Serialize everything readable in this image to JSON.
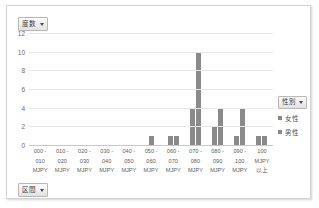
{
  "chart": {
    "value_field_label": "度数",
    "axis_field_label": "区間",
    "dropdown_icon": "chevron-down-icon"
  },
  "legend": {
    "title": "性別",
    "dropdown_icon": "chevron-down-icon",
    "entries": [
      {
        "label": "女性",
        "color": "#8a8a8a"
      },
      {
        "label": "男性",
        "color": "#8a8a8a"
      }
    ]
  },
  "chart_data": {
    "type": "bar",
    "title": "度数",
    "xlabel": "区間",
    "ylabel": "度数",
    "ylim": [
      0,
      12
    ],
    "yticks": [
      0,
      2,
      4,
      6,
      8,
      10,
      12
    ],
    "grid": true,
    "legend_position": "right",
    "categories": [
      "000 - 010 MJPY",
      "010 - 020 MJPY",
      "020 - 030 MJPY",
      "030 - 040 MJPY",
      "040 - 050 MJPY",
      "050 - 060 MJPY",
      "060 - 070 MJPY",
      "070 - 080 MJPY",
      "080 - 090 MJPY",
      "090 - 100 MJPY",
      "100 MJPY 以上"
    ],
    "category_lines": [
      [
        "000 -",
        "010",
        "MJPY"
      ],
      [
        "010 -",
        "020",
        "MJPY"
      ],
      [
        "020 -",
        "030",
        "MJPY"
      ],
      [
        "030 -",
        "040",
        "MJPY"
      ],
      [
        "040 -",
        "050",
        "MJPY"
      ],
      [
        "050 -",
        "060",
        "MJPY"
      ],
      [
        "060 -",
        "070",
        "MJPY"
      ],
      [
        "070 -",
        "080",
        "MJPY"
      ],
      [
        "080 -",
        "090",
        "MJPY"
      ],
      [
        "090 -",
        "100",
        "MJPY"
      ],
      [
        "100",
        "MJPY",
        "以上"
      ]
    ],
    "series": [
      {
        "name": "女性",
        "color": "#8a8a8a",
        "values": [
          0,
          0,
          0,
          0,
          0,
          1,
          1,
          4,
          2,
          1,
          1
        ]
      },
      {
        "name": "男性",
        "color": "#8a8a8a",
        "values": [
          0,
          0,
          0,
          0,
          0,
          0,
          1,
          10,
          4,
          4,
          1
        ]
      }
    ]
  }
}
